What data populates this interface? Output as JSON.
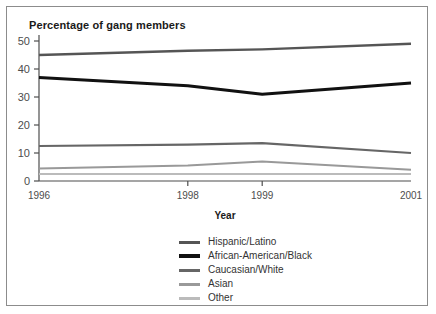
{
  "figure": {
    "title": "Percentage of gang members",
    "background": "#ffffff",
    "border_color": "#8c8c8c"
  },
  "chart_data": {
    "type": "line",
    "title": "Percentage of gang members",
    "xlabel": "Year",
    "ylabel": "",
    "categories": [
      "1996",
      "1998",
      "1999",
      "2001"
    ],
    "x": [
      1996,
      1998,
      1999,
      2001
    ],
    "xlim": [
      1996,
      2001
    ],
    "ylim": [
      0,
      50
    ],
    "yticks": [
      0,
      10,
      20,
      30,
      40,
      50
    ],
    "grid": false,
    "legend_position": "below-center",
    "series": [
      {
        "name": "Hispanic/Latino",
        "color": "#555555",
        "width": 2.4,
        "values": [
          45,
          46.5,
          47,
          49
        ]
      },
      {
        "name": "African-American/Black",
        "color": "#111111",
        "width": 3.0,
        "values": [
          37,
          34,
          31,
          35
        ]
      },
      {
        "name": "Caucasian/White",
        "color": "#666666",
        "width": 2.2,
        "values": [
          12.5,
          13,
          13.5,
          10
        ]
      },
      {
        "name": "Asian",
        "color": "#999999",
        "width": 2.0,
        "values": [
          4.5,
          5.5,
          7,
          4
        ]
      },
      {
        "name": "Other",
        "color": "#bbbbbb",
        "width": 2.0,
        "values": [
          2.5,
          2.5,
          2.5,
          2.5
        ]
      }
    ]
  },
  "axes": {
    "ytick_labels": [
      "50",
      "40",
      "30",
      "20",
      "10",
      "0"
    ],
    "xtick_labels": [
      "1996",
      "1998",
      "1999",
      "2001"
    ],
    "x_axis_title": "Year"
  },
  "legend": {
    "items": [
      {
        "label": "Hispanic/Latino",
        "color": "#555555",
        "thickness": "3px"
      },
      {
        "label": "African-American/Black",
        "color": "#111111",
        "thickness": "4px"
      },
      {
        "label": "Caucasian/White",
        "color": "#666666",
        "thickness": "3px"
      },
      {
        "label": "Asian",
        "color": "#999999",
        "thickness": "3px"
      },
      {
        "label": "Other",
        "color": "#bbbbbb",
        "thickness": "3px"
      }
    ]
  }
}
